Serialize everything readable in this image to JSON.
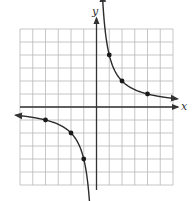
{
  "chart_data": {
    "type": "line",
    "title": "",
    "function": "y = 4/x",
    "xlabel": "x",
    "ylabel": "y",
    "xlim": [
      -6,
      6
    ],
    "ylim": [
      -6,
      6
    ],
    "grid": true,
    "grid_step": 1,
    "legend": "none",
    "series": [
      {
        "name": "upper-branch",
        "points": [
          [
            1,
            4
          ],
          [
            2,
            2
          ],
          [
            4,
            1
          ]
        ],
        "arrow_ends": [
          "up",
          "right"
        ]
      },
      {
        "name": "lower-branch",
        "points": [
          [
            -4,
            -1
          ],
          [
            -2,
            -2
          ],
          [
            -1,
            -4
          ]
        ],
        "arrow_ends": [
          "left",
          "down"
        ]
      }
    ],
    "marked_points": [
      [
        1,
        4
      ],
      [
        2,
        2
      ],
      [
        4,
        1
      ],
      [
        -4,
        -1
      ],
      [
        -2,
        -2
      ],
      [
        -1,
        -4
      ]
    ]
  },
  "style": {
    "grid_color": "#b8b8b8",
    "axis_color": "#333333",
    "curve_color": "#2b2b2b",
    "point_color": "#1a1a1a"
  },
  "labels": {
    "x_axis": "x",
    "y_axis": "y"
  }
}
